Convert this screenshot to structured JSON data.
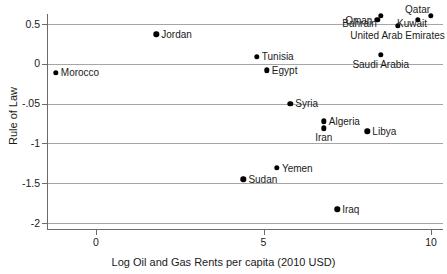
{
  "chart_data": {
    "type": "scatter",
    "title": "",
    "xlabel": "Log Oil and Gas Rents per capita (2010 USD)",
    "ylabel": "Rule of Law",
    "xlim": [
      -1.9,
      10.8
    ],
    "ylim": [
      -2.05,
      0.72
    ],
    "x_ticks": [
      0,
      5,
      10
    ],
    "x_tick_labels": [
      "0",
      "5",
      "10"
    ],
    "y_ticks": [
      0.5,
      0,
      -0.5,
      -1,
      -1.5,
      -2
    ],
    "y_tick_labels": [
      "0.5",
      "0",
      "-.05",
      "-1",
      "-1.5",
      "-2"
    ],
    "grid": "horizontal",
    "legend": "none",
    "point_color": "#000000",
    "grid_color": "#a6a6a6",
    "axis_color": "#6b6b6b",
    "points": [
      {
        "label": "Morocco",
        "x": -1.2,
        "y": -0.11,
        "label_pos": "right"
      },
      {
        "label": "Jordan",
        "x": 1.8,
        "y": 0.37,
        "label_pos": "right"
      },
      {
        "label": "Sudan",
        "x": 4.4,
        "y": -1.45,
        "label_pos": "right"
      },
      {
        "label": "Tunisia",
        "x": 4.8,
        "y": 0.09,
        "label_pos": "right"
      },
      {
        "label": "Egypt",
        "x": 5.1,
        "y": -0.08,
        "label_pos": "right"
      },
      {
        "label": "Yemen",
        "x": 5.4,
        "y": -1.31,
        "label_pos": "right"
      },
      {
        "label": "Syria",
        "x": 5.8,
        "y": -0.5,
        "label_pos": "right"
      },
      {
        "label": "Algeria",
        "x": 6.8,
        "y": -0.72,
        "label_pos": "right"
      },
      {
        "label": "Iran",
        "x": 6.8,
        "y": -0.81,
        "label_pos": "below"
      },
      {
        "label": "Iraq",
        "x": 7.2,
        "y": -1.83,
        "label_pos": "right"
      },
      {
        "label": "Libya",
        "x": 8.1,
        "y": -0.85,
        "label_pos": "right"
      },
      {
        "label": "Oman",
        "x": 8.4,
        "y": 0.55,
        "label_pos": "left"
      },
      {
        "label": "Bahrain",
        "x": 8.5,
        "y": 0.6,
        "label_pos": "below-left"
      },
      {
        "label": "Saudi Arabia",
        "x": 8.5,
        "y": 0.11,
        "label_pos": "below"
      },
      {
        "label": "United Arab Emirates",
        "x": 9.0,
        "y": 0.48,
        "label_pos": "below"
      },
      {
        "label": "Qatar",
        "x": 9.6,
        "y": 0.55,
        "label_pos": "above"
      },
      {
        "label": "Kuwait",
        "x": 10.0,
        "y": 0.6,
        "label_pos": "below-left"
      }
    ]
  }
}
